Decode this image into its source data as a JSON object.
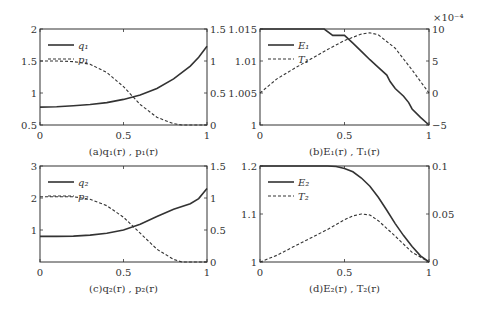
{
  "chart_data": [
    {
      "id": "a",
      "type": "line",
      "caption": "(a)q₁(r) , p₁(r)",
      "frame": {
        "left": 40,
        "top": 29,
        "right": 207,
        "bottom": 125
      },
      "xlim": [
        0,
        1
      ],
      "xticks": [
        0,
        0.5,
        1
      ],
      "xtick_labels": [
        "0",
        "0.5",
        "1"
      ],
      "ylim_left": [
        0.5,
        2
      ],
      "yticks_left": [
        0.5,
        1,
        1.5,
        2
      ],
      "ytick_labels_left": [
        "0.5",
        "1",
        "1.5",
        "2"
      ],
      "ylim_right": [
        0,
        1.5
      ],
      "yticks_right": [
        0,
        0.5,
        1,
        1.5
      ],
      "ytick_labels_right": [
        "0",
        "0.5",
        "1",
        "1.5"
      ],
      "legend": [
        {
          "label": "q₁",
          "style": "solid"
        },
        {
          "label": "p₁",
          "style": "dashed"
        }
      ],
      "series": [
        {
          "name": "q1",
          "axis": "left",
          "style": "solid",
          "x": [
            0,
            0.1,
            0.2,
            0.3,
            0.4,
            0.5,
            0.6,
            0.7,
            0.8,
            0.9,
            0.95,
            1
          ],
          "y": [
            0.78,
            0.785,
            0.8,
            0.82,
            0.85,
            0.9,
            0.97,
            1.07,
            1.22,
            1.42,
            1.56,
            1.73
          ]
        },
        {
          "name": "p1",
          "axis": "right",
          "style": "dashed",
          "x": [
            0,
            0.1,
            0.2,
            0.3,
            0.4,
            0.5,
            0.6,
            0.7,
            0.8,
            0.85,
            0.9,
            1
          ],
          "y": [
            1.0,
            1.0,
            0.99,
            0.95,
            0.82,
            0.6,
            0.32,
            0.12,
            0.02,
            0.0,
            0.0,
            0.0
          ]
        }
      ]
    },
    {
      "id": "b",
      "type": "line",
      "caption": "(b)E₁(r) , T₁(r)",
      "frame": {
        "left": 260,
        "top": 29,
        "right": 429,
        "bottom": 125
      },
      "xlim": [
        0,
        1
      ],
      "xticks": [
        0,
        0.5,
        1
      ],
      "xtick_labels": [
        "0",
        "0.5",
        "1"
      ],
      "ylim_left": [
        1,
        1.015
      ],
      "yticks_left": [
        1,
        1.005,
        1.01,
        1.015
      ],
      "ytick_labels_left": [
        "1",
        "1.005",
        "1.01",
        "1.015"
      ],
      "ylim_right": [
        -5,
        10
      ],
      "yticks_right": [
        -5,
        0,
        5,
        10
      ],
      "ytick_labels_right": [
        "−5",
        "0",
        "5",
        "10"
      ],
      "right_axis_multiplier": "×10⁻⁴",
      "legend": [
        {
          "label": "E₁",
          "style": "solid"
        },
        {
          "label": "T₁",
          "style": "dashed"
        }
      ],
      "series": [
        {
          "name": "E1",
          "axis": "left",
          "style": "solid",
          "x": [
            0,
            0.38,
            0.43,
            0.5,
            0.55,
            0.6,
            0.65,
            0.7,
            0.75,
            0.77,
            0.8,
            0.85,
            0.88,
            0.9,
            0.95,
            1
          ],
          "y": [
            1.015,
            1.015,
            1.014,
            1.014,
            1.0128,
            1.0115,
            1.0102,
            1.009,
            1.0078,
            1.0068,
            1.0057,
            1.0045,
            1.0035,
            1.0025,
            1.0012,
            1.0
          ]
        },
        {
          "name": "T1",
          "axis": "right",
          "style": "dashed",
          "x": [
            0,
            0.1,
            0.2,
            0.3,
            0.4,
            0.5,
            0.6,
            0.65,
            0.7,
            0.8,
            0.9,
            1
          ],
          "y": [
            0,
            2.2,
            3.8,
            5.3,
            6.8,
            8.2,
            9.2,
            9.4,
            9.1,
            7.0,
            3.6,
            0
          ]
        }
      ]
    },
    {
      "id": "c",
      "type": "line",
      "caption": "(c)q₂(r) , p₂(r)",
      "frame": {
        "left": 40,
        "top": 166,
        "right": 207,
        "bottom": 262
      },
      "xlim": [
        0,
        1
      ],
      "xticks": [
        0,
        0.5,
        1
      ],
      "xtick_labels": [
        "0",
        "0.5",
        "1"
      ],
      "ylim_left": [
        0,
        3
      ],
      "yticks_left": [
        1,
        2,
        3
      ],
      "ytick_labels_left": [
        "1",
        "2",
        "3"
      ],
      "ylim_right": [
        0,
        1.5
      ],
      "yticks_right": [
        0,
        0.5,
        1,
        1.5
      ],
      "ytick_labels_right": [
        "0",
        "0.5",
        "1",
        "1.5"
      ],
      "legend": [
        {
          "label": "q₂",
          "style": "solid"
        },
        {
          "label": "p₂",
          "style": "dashed"
        }
      ],
      "series": [
        {
          "name": "q2",
          "axis": "left",
          "style": "solid",
          "x": [
            0,
            0.1,
            0.2,
            0.3,
            0.4,
            0.5,
            0.6,
            0.7,
            0.8,
            0.9,
            0.95,
            1
          ],
          "y": [
            0.8,
            0.8,
            0.81,
            0.84,
            0.9,
            1.0,
            1.18,
            1.42,
            1.65,
            1.82,
            1.98,
            2.3
          ]
        },
        {
          "name": "p2",
          "axis": "right",
          "style": "dashed",
          "x": [
            0,
            0.1,
            0.2,
            0.3,
            0.4,
            0.5,
            0.6,
            0.7,
            0.8,
            0.85,
            0.9,
            1
          ],
          "y": [
            1.02,
            1.02,
            1.02,
            0.98,
            0.88,
            0.7,
            0.45,
            0.2,
            0.04,
            0.0,
            0.0,
            0.0
          ]
        }
      ]
    },
    {
      "id": "d",
      "type": "line",
      "caption": "(d)E₂(r) , T₂(r)",
      "frame": {
        "left": 260,
        "top": 166,
        "right": 429,
        "bottom": 262
      },
      "xlim": [
        0,
        1
      ],
      "xticks": [
        0,
        0.5,
        1
      ],
      "xtick_labels": [
        "0",
        "0.5",
        "1"
      ],
      "ylim_left": [
        1,
        1.2
      ],
      "yticks_left": [
        1,
        1.1,
        1.2
      ],
      "ytick_labels_left": [
        "1",
        "1.1",
        "1.2"
      ],
      "ylim_right": [
        0,
        0.1
      ],
      "yticks_right": [
        0,
        0.05,
        0.1
      ],
      "ytick_labels_right": [
        "0",
        "0.05",
        "0.1"
      ],
      "legend": [
        {
          "label": "E₂",
          "style": "solid"
        },
        {
          "label": "T₂",
          "style": "dashed"
        }
      ],
      "series": [
        {
          "name": "E2",
          "axis": "left",
          "style": "solid",
          "x": [
            0,
            0.3,
            0.4,
            0.45,
            0.5,
            0.55,
            0.6,
            0.65,
            0.7,
            0.75,
            0.8,
            0.85,
            0.9,
            0.95,
            1
          ],
          "y": [
            1.2,
            1.2,
            1.2,
            1.199,
            1.195,
            1.188,
            1.175,
            1.158,
            1.135,
            1.108,
            1.08,
            1.055,
            1.032,
            1.013,
            1.0
          ]
        },
        {
          "name": "T2",
          "axis": "right",
          "style": "dashed",
          "x": [
            0,
            0.1,
            0.2,
            0.3,
            0.4,
            0.5,
            0.55,
            0.6,
            0.65,
            0.7,
            0.8,
            0.9,
            1
          ],
          "y": [
            0,
            0.007,
            0.016,
            0.025,
            0.034,
            0.044,
            0.048,
            0.05,
            0.049,
            0.043,
            0.027,
            0.01,
            0
          ]
        }
      ]
    }
  ]
}
